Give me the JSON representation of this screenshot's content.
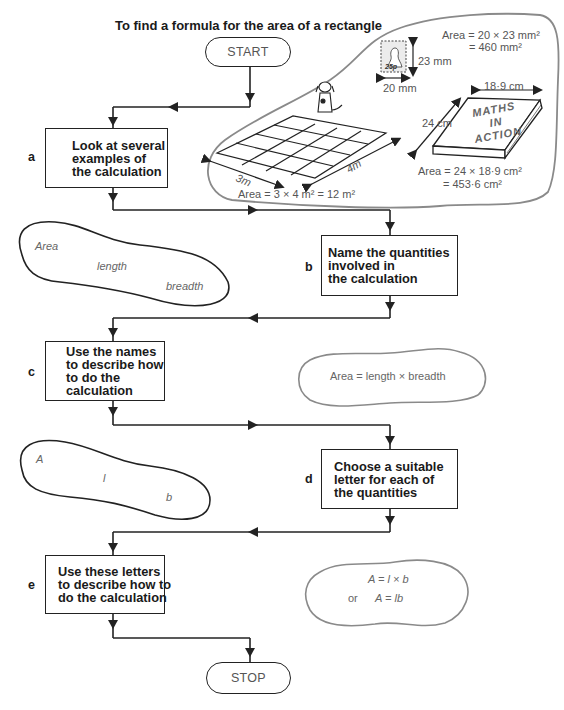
{
  "title": "To find a formula for the area of a rectangle",
  "start_label": "START",
  "stop_label": "STOP",
  "steps": [
    {
      "id": "a",
      "letter": "a",
      "lines": [
        "Look at several",
        "examples of",
        "the calculation"
      ]
    },
    {
      "id": "b",
      "letter": "b",
      "lines": [
        "Name the quantities",
        "involved in",
        "the calculation"
      ]
    },
    {
      "id": "c",
      "letter": "c",
      "lines": [
        "Use the names",
        "to describe how",
        "to do the",
        "calculation"
      ]
    },
    {
      "id": "d",
      "letter": "d",
      "lines": [
        "Choose a suitable",
        "letter for each of",
        "the quantities"
      ]
    },
    {
      "id": "e",
      "letter": "e",
      "lines": [
        "Use these letters",
        "to describe how to",
        "do the calculation"
      ]
    }
  ],
  "examples": {
    "stamp": {
      "label": "25p",
      "width": "20 mm",
      "height": "23 mm",
      "area_line1": "Area = 20 × 23 mm²",
      "area_line2": "= 460 mm²"
    },
    "floor": {
      "width": "3m",
      "length": "4m",
      "area": "Area = 3 × 4 m² = 12 m²"
    },
    "book": {
      "title_lines": [
        "MATHS",
        "IN",
        "ACTION"
      ],
      "width": "18·9 cm",
      "height": "24 cm",
      "area_line1": "Area = 24 × 18·9 cm²",
      "area_line2": "= 453·6 cm²"
    }
  },
  "blobs": {
    "names": [
      "Area",
      "length",
      "breadth"
    ],
    "names_formula": "Area = length × breadth",
    "letters": [
      "A",
      "l",
      "b"
    ],
    "letter_formula_1": "A = l × b",
    "letter_formula_or": "or",
    "letter_formula_2": "A = lb"
  }
}
